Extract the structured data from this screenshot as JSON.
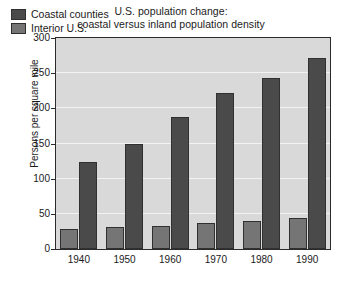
{
  "chart_data": {
    "type": "bar",
    "title": "U.S. population change: coastal versus inland population density",
    "title_line1": "U.S. population change:",
    "title_line2": "coastal versus inland population density",
    "xlabel": "",
    "ylabel": "Persons per square mile",
    "categories": [
      "1940",
      "1950",
      "1960",
      "1970",
      "1980",
      "1990"
    ],
    "series": [
      {
        "name": "Interior U.S.",
        "color": "#757575",
        "values": [
          28,
          31,
          33,
          37,
          40,
          44
        ]
      },
      {
        "name": "Coastal counties",
        "color": "#4a4a4a",
        "values": [
          124,
          150,
          188,
          222,
          243,
          272
        ]
      }
    ],
    "ylim": [
      0,
      300
    ],
    "yticks": [
      0,
      50,
      100,
      150,
      200,
      250,
      300
    ],
    "ytick_labels": [
      "0",
      "50",
      "100",
      "150",
      "200",
      "250",
      "300"
    ],
    "grid": true,
    "grid_color": "#f2f2f2",
    "legend_position": "upper left",
    "legend_order": [
      "Coastal counties",
      "Interior U.S."
    ],
    "plot_background": "#d9d9d9",
    "frame_color": "#2b2b2b"
  },
  "legend": {
    "items": [
      {
        "label": "Coastal counties",
        "color": "#4a4a4a"
      },
      {
        "label": "Interior U.S.",
        "color": "#757575"
      }
    ]
  }
}
